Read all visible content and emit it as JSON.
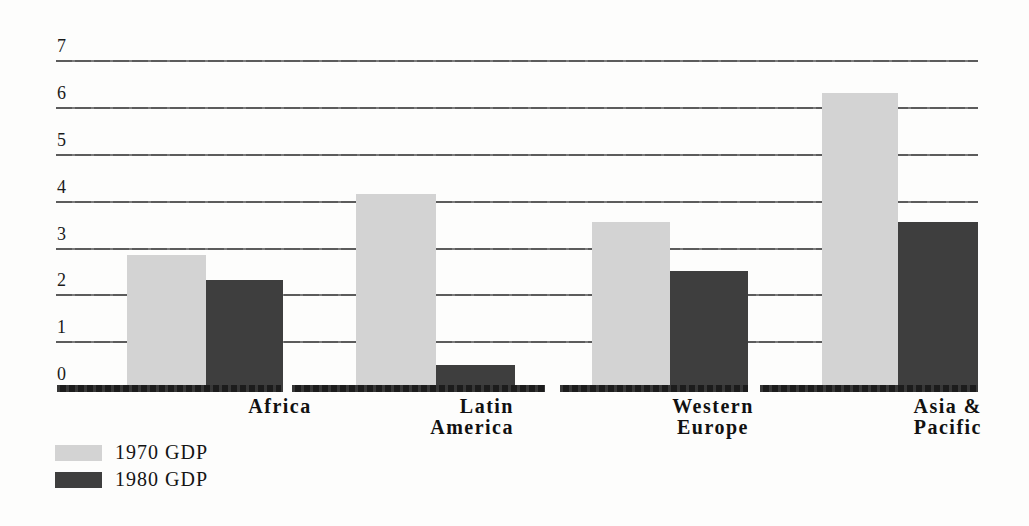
{
  "chart_data": {
    "type": "bar",
    "title": "",
    "xlabel": "",
    "ylabel": "",
    "categories": [
      "Africa",
      "Latin America",
      "Western Europe",
      "Asia & Pacific"
    ],
    "category_label_lines": [
      [
        "Africa"
      ],
      [
        "Latin",
        "America"
      ],
      [
        "Western",
        "Europe"
      ],
      [
        "Asia &",
        "Pacific"
      ]
    ],
    "series": [
      {
        "name": "1970 GDP",
        "color": "#d3d3d3",
        "values": [
          2.85,
          4.15,
          3.55,
          6.3
        ]
      },
      {
        "name": "1980 GDP",
        "color": "#3e3e3e",
        "values": [
          2.3,
          0.5,
          2.5,
          3.55
        ]
      }
    ],
    "ylim": [
      0,
      7
    ],
    "yticks": [
      0,
      1,
      2,
      3,
      4,
      5,
      6,
      7
    ],
    "grid": true,
    "legend_position": "bottom-left"
  },
  "colors": {
    "background": "#fdfdfc",
    "gridline": "#4a4a4a",
    "baseline": "#1c1c1c",
    "bar_1970": "#d3d3d3",
    "bar_1980": "#3e3e3e",
    "text": "#161616"
  }
}
